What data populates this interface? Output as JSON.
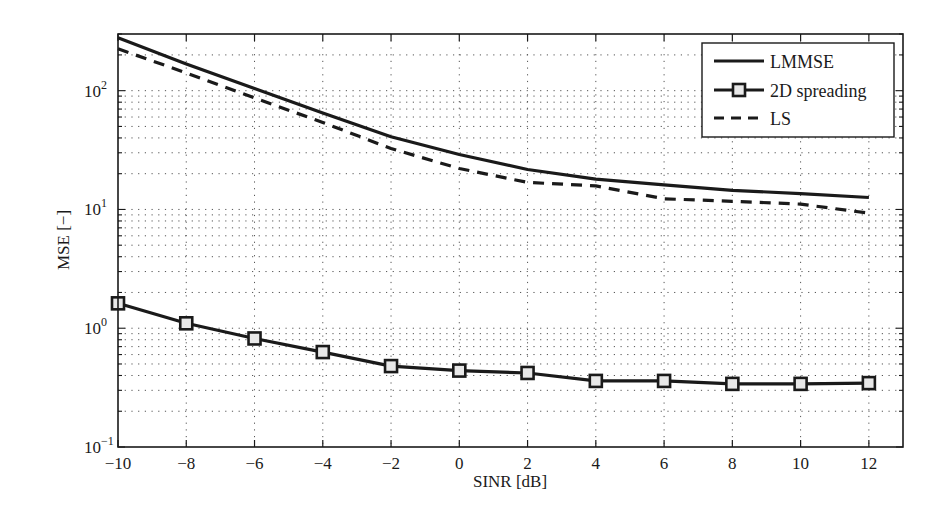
{
  "chart_data": {
    "type": "line",
    "title": "",
    "xlabel": "SINR [dB]",
    "ylabel": "MSE [−]",
    "yscale": "log",
    "xlim": [
      -10,
      13
    ],
    "ylim": [
      0.1,
      300
    ],
    "grid": true,
    "legend_position": "upper right",
    "x": [
      -10,
      -8,
      -6,
      -4,
      -2,
      0,
      2,
      4,
      6,
      8,
      10,
      12
    ],
    "x_ticks": [
      -10,
      -8,
      -6,
      -4,
      -2,
      0,
      2,
      4,
      6,
      8,
      10,
      12
    ],
    "x_tick_labels": [
      "−10",
      "−8",
      "−6",
      "−4",
      "−2",
      "0",
      "2",
      "4",
      "6",
      "8",
      "10",
      "12"
    ],
    "y_ticks": [
      0.1,
      1,
      10,
      100
    ],
    "y_tick_labels": [
      {
        "base": "10",
        "exp": "−1"
      },
      {
        "base": "10",
        "exp": "0"
      },
      {
        "base": "10",
        "exp": "1"
      },
      {
        "base": "10",
        "exp": "2"
      }
    ],
    "series": [
      {
        "name": "LMMSE",
        "style": "solid",
        "marker": "none",
        "color": "#1a1a1a",
        "values": [
          279,
          168,
          104,
          65,
          41,
          29,
          21.7,
          18.0,
          16.1,
          14.5,
          13.6,
          12.6
        ]
      },
      {
        "name": "2D spreading",
        "style": "solid",
        "marker": "square",
        "color": "#1a1a1a",
        "values": [
          1.62,
          1.1,
          0.82,
          0.63,
          0.48,
          0.44,
          0.42,
          0.36,
          0.36,
          0.34,
          0.34,
          0.345
        ]
      },
      {
        "name": "LS",
        "style": "dashed",
        "marker": "none",
        "color": "#1a1a1a",
        "values": [
          225,
          141,
          87,
          54,
          32.6,
          22.1,
          16.9,
          15.8,
          12.3,
          11.7,
          11.1,
          9.3
        ]
      }
    ]
  }
}
